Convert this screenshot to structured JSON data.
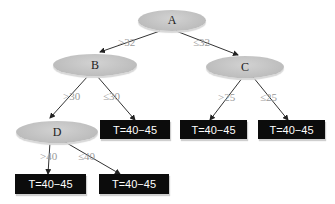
{
  "nodes": {
    "A": {
      "label": "A"
    },
    "B": {
      "label": "B"
    },
    "C": {
      "label": "C"
    },
    "D": {
      "label": "D"
    }
  },
  "edges": {
    "A_B": ">32",
    "A_C": "≤32",
    "B_D": ">30",
    "B_leaf": "≤30",
    "C_leaf1": ">25",
    "C_leaf2": "≤25",
    "D_leaf1": ">40",
    "D_leaf2": "≤40"
  },
  "leaves": [
    {
      "label": "T=40−45"
    },
    {
      "label": "T=40−45"
    },
    {
      "label": "T=40−45"
    },
    {
      "label": "T=40−45"
    },
    {
      "label": "T=40−45"
    }
  ],
  "colors": {
    "node_fill": "#bdbdbd",
    "leaf_fill": "#0c0c0c",
    "edge": "#333333",
    "edge_label": "#9a9a9a"
  }
}
